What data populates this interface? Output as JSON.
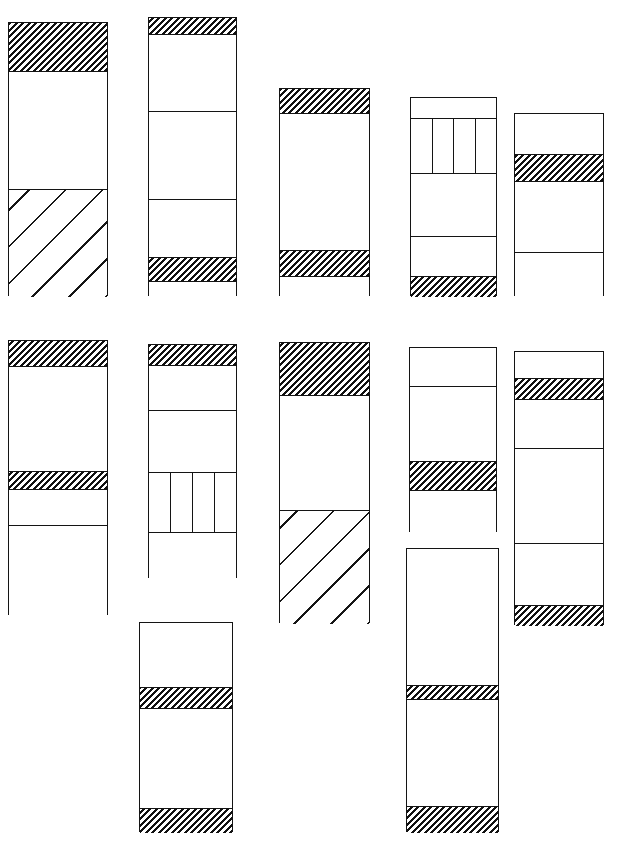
{
  "figure": {
    "title": "",
    "background_color": "#ffffff",
    "stroke_color": "#141414",
    "width": 644,
    "height": 845
  },
  "legend": {
    "fill_names": [
      "plain",
      "hatch-dense",
      "hatch-sparse",
      "vertical-divided"
    ]
  },
  "chart_data": {
    "type": "bar",
    "title": "",
    "subtitle": "",
    "xlabel": "",
    "ylabel": "",
    "grid": false,
    "legend_position": "none",
    "fill_legend": {
      "plain": "unfilled / blank unit",
      "hatch-dense": "dense fine diagonal hatch unit",
      "hatch-sparse": "sparse wide diagonal hatch unit",
      "vertical-divided": "unit subdivided by vertical rules"
    },
    "columns": [
      {
        "id": "r1c1",
        "row": 1,
        "index": 1,
        "x": 8,
        "y": 22,
        "width": 100,
        "height": 274,
        "segments": [
          {
            "fill": "hatch-dense",
            "height": 48
          },
          {
            "fill": "plain",
            "height": 118
          },
          {
            "fill": "hatch-sparse",
            "height": 108
          }
        ]
      },
      {
        "id": "r1c2",
        "row": 1,
        "index": 2,
        "x": 148,
        "y": 17,
        "width": 89,
        "height": 279,
        "segments": [
          {
            "fill": "hatch-dense",
            "height": 16
          },
          {
            "fill": "plain",
            "height": 77
          },
          {
            "fill": "plain",
            "height": 88
          },
          {
            "fill": "plain",
            "height": 58
          },
          {
            "fill": "hatch-dense",
            "height": 24
          },
          {
            "fill": "plain",
            "height": 16
          }
        ]
      },
      {
        "id": "r1c3",
        "row": 1,
        "index": 3,
        "x": 279,
        "y": 88,
        "width": 91,
        "height": 208,
        "segments": [
          {
            "fill": "hatch-dense",
            "height": 24
          },
          {
            "fill": "plain",
            "height": 137
          },
          {
            "fill": "hatch-dense",
            "height": 26
          },
          {
            "fill": "plain",
            "height": 21
          }
        ]
      },
      {
        "id": "r1c4",
        "row": 1,
        "index": 4,
        "x": 410,
        "y": 97,
        "width": 87,
        "height": 199,
        "segments": [
          {
            "fill": "plain",
            "height": 20
          },
          {
            "fill": "vertical-divided",
            "height": 55,
            "cells": 4
          },
          {
            "fill": "plain",
            "height": 63
          },
          {
            "fill": "plain",
            "height": 40
          },
          {
            "fill": "hatch-dense",
            "height": 21
          }
        ]
      },
      {
        "id": "r1c5",
        "row": 1,
        "index": 5,
        "x": 514,
        "y": 113,
        "width": 90,
        "height": 183,
        "segments": [
          {
            "fill": "plain",
            "height": 40
          },
          {
            "fill": "hatch-dense",
            "height": 27
          },
          {
            "fill": "plain",
            "height": 71
          },
          {
            "fill": "plain",
            "height": 45
          }
        ]
      },
      {
        "id": "r2c1",
        "row": 2,
        "index": 1,
        "x": 8,
        "y": 340,
        "width": 100,
        "height": 275,
        "segments": [
          {
            "fill": "hatch-dense",
            "height": 25
          },
          {
            "fill": "plain",
            "height": 105
          },
          {
            "fill": "hatch-dense",
            "height": 18
          },
          {
            "fill": "plain",
            "height": 36
          },
          {
            "fill": "plain",
            "height": 91
          }
        ]
      },
      {
        "id": "r2c2",
        "row": 2,
        "index": 2,
        "x": 148,
        "y": 344,
        "width": 89,
        "height": 234,
        "segments": [
          {
            "fill": "hatch-dense",
            "height": 20
          },
          {
            "fill": "plain",
            "height": 45
          },
          {
            "fill": "plain",
            "height": 62
          },
          {
            "fill": "vertical-divided",
            "height": 60,
            "cells": 4
          },
          {
            "fill": "plain",
            "height": 47
          }
        ]
      },
      {
        "id": "r2c3",
        "row": 2,
        "index": 3,
        "x": 279,
        "y": 342,
        "width": 91,
        "height": 281,
        "segments": [
          {
            "fill": "hatch-dense",
            "height": 52
          },
          {
            "fill": "plain",
            "height": 115
          },
          {
            "fill": "hatch-sparse",
            "height": 114
          }
        ]
      },
      {
        "id": "r2c4",
        "row": 2,
        "index": 4,
        "x": 409,
        "y": 347,
        "width": 88,
        "height": 185,
        "segments": [
          {
            "fill": "plain",
            "height": 38
          },
          {
            "fill": "plain",
            "height": 75
          },
          {
            "fill": "hatch-dense",
            "height": 29
          },
          {
            "fill": "plain",
            "height": 43
          }
        ]
      },
      {
        "id": "r2c5",
        "row": 2,
        "index": 5,
        "x": 514,
        "y": 351,
        "width": 90,
        "height": 274,
        "segments": [
          {
            "fill": "plain",
            "height": 26
          },
          {
            "fill": "hatch-dense",
            "height": 21
          },
          {
            "fill": "plain",
            "height": 49
          },
          {
            "fill": "plain",
            "height": 95
          },
          {
            "fill": "plain",
            "height": 62
          },
          {
            "fill": "hatch-dense",
            "height": 21
          }
        ]
      },
      {
        "id": "r3c2",
        "row": 3,
        "index": 2,
        "x": 139,
        "y": 622,
        "width": 94,
        "height": 210,
        "segments": [
          {
            "fill": "plain",
            "height": 64
          },
          {
            "fill": "hatch-dense",
            "height": 21
          },
          {
            "fill": "plain",
            "height": 100
          },
          {
            "fill": "hatch-dense",
            "height": 25
          }
        ]
      },
      {
        "id": "r3c4",
        "row": 3,
        "index": 4,
        "x": 406,
        "y": 548,
        "width": 93,
        "height": 284,
        "segments": [
          {
            "fill": "plain",
            "height": 136
          },
          {
            "fill": "hatch-dense",
            "height": 14
          },
          {
            "fill": "plain",
            "height": 107
          },
          {
            "fill": "hatch-dense",
            "height": 27
          }
        ]
      }
    ]
  }
}
